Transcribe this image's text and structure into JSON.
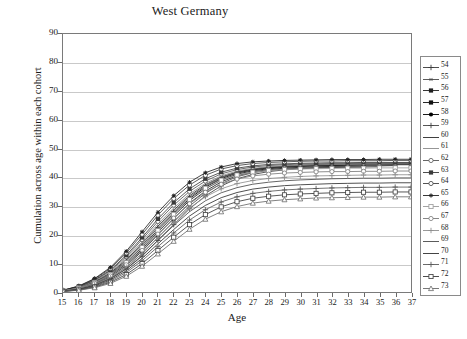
{
  "chart_data": {
    "type": "line",
    "title": "West Germany",
    "xlabel": "Age",
    "ylabel": "Cumulation across age within each cohort",
    "xlim": [
      15,
      37
    ],
    "ylim": [
      0,
      90
    ],
    "ytick_step": 10,
    "grid": true,
    "legend_position": "right-outside",
    "x": [
      15,
      16,
      17,
      18,
      19,
      20,
      21,
      22,
      23,
      24,
      25,
      26,
      27,
      28,
      29,
      30,
      31,
      32,
      33,
      34,
      35,
      36,
      37
    ],
    "yticks": [
      "0",
      "10",
      "20",
      "30",
      "40",
      "50",
      "60",
      "70",
      "80",
      "90"
    ],
    "xticks": [
      "15",
      "16",
      "17",
      "18",
      "19",
      "20",
      "21",
      "22",
      "23",
      "24",
      "25",
      "26",
      "27",
      "28",
      "29",
      "30",
      "31",
      "32",
      "33",
      "34",
      "35",
      "36",
      "37"
    ],
    "series": [
      {
        "name": "54",
        "marker": "plus",
        "color": "#3a3a3a",
        "values": [
          0.3,
          1.0,
          2.4,
          4.6,
          8.0,
          12.5,
          18.0,
          23.5,
          29.0,
          33.5,
          37.0,
          39.5,
          41.0,
          42.0,
          42.6,
          43.0,
          43.2,
          43.4,
          43.5,
          43.6,
          null,
          null,
          null
        ]
      },
      {
        "name": "55",
        "marker": "asterisk",
        "color": "#4a4a4a",
        "values": [
          0.3,
          1.1,
          2.6,
          5.0,
          8.6,
          13.4,
          19.0,
          24.6,
          30.0,
          34.4,
          37.8,
          40.2,
          41.6,
          42.4,
          42.9,
          43.2,
          43.4,
          43.5,
          43.6,
          43.6,
          43.7,
          null,
          null
        ]
      },
      {
        "name": "56",
        "marker": "square-filled",
        "color": "#1f1f1f",
        "values": [
          0.4,
          1.2,
          2.8,
          5.4,
          9.2,
          14.2,
          20.0,
          25.6,
          31.0,
          35.2,
          38.4,
          40.6,
          41.9,
          42.7,
          43.2,
          43.5,
          43.7,
          43.8,
          43.9,
          44.0,
          44.0,
          44.1,
          null
        ]
      },
      {
        "name": "57",
        "marker": "square-filled",
        "color": "#111111",
        "values": [
          0.4,
          1.3,
          3.0,
          5.8,
          9.8,
          15.0,
          20.9,
          26.6,
          31.9,
          36.0,
          39.0,
          41.1,
          42.3,
          43.0,
          43.5,
          43.8,
          44.0,
          44.1,
          44.2,
          44.3,
          44.3,
          44.4,
          44.4
        ]
      },
      {
        "name": "58",
        "marker": "circle-filled",
        "color": "#000000",
        "values": [
          0.4,
          1.4,
          3.2,
          6.1,
          10.3,
          15.7,
          21.7,
          27.4,
          32.6,
          36.6,
          39.5,
          41.5,
          42.6,
          43.3,
          43.7,
          44.0,
          44.2,
          44.3,
          44.4,
          44.5,
          44.5,
          44.6,
          44.6
        ]
      },
      {
        "name": "59",
        "marker": "plus",
        "color": "#444444",
        "values": [
          0.5,
          1.5,
          3.4,
          6.4,
          10.8,
          16.3,
          22.4,
          28.0,
          33.1,
          37.0,
          39.8,
          41.7,
          42.8,
          43.4,
          43.8,
          44.1,
          44.3,
          44.4,
          44.5,
          44.6,
          44.6,
          44.7,
          44.7
        ]
      },
      {
        "name": "60",
        "marker": "line",
        "color": "#2a2a2a",
        "values": [
          0.5,
          1.6,
          3.6,
          6.7,
          11.2,
          16.9,
          23.0,
          28.6,
          33.6,
          37.4,
          40.1,
          41.9,
          42.9,
          43.5,
          43.9,
          44.2,
          44.3,
          44.4,
          44.5,
          44.6,
          44.6,
          44.7,
          44.7
        ]
      },
      {
        "name": "61",
        "marker": "line",
        "color": "#8a8a8a",
        "values": [
          0.5,
          1.7,
          3.8,
          7.0,
          11.7,
          17.5,
          23.7,
          29.3,
          34.2,
          37.9,
          40.5,
          42.2,
          43.1,
          43.7,
          44.0,
          44.2,
          44.4,
          44.5,
          44.5,
          44.6,
          44.6,
          44.7,
          44.7
        ]
      },
      {
        "name": "62",
        "marker": "circle-open",
        "color": "#555555",
        "values": [
          0.5,
          1.8,
          4.0,
          7.4,
          12.3,
          18.3,
          24.6,
          30.3,
          35.1,
          38.7,
          41.2,
          42.7,
          43.6,
          44.1,
          44.4,
          44.6,
          44.7,
          44.8,
          44.8,
          44.9,
          44.9,
          45.0,
          45.0
        ]
      },
      {
        "name": "63",
        "marker": "square-filled",
        "color": "#3a3a3a",
        "values": [
          0.6,
          1.9,
          4.2,
          7.7,
          12.8,
          19.0,
          25.5,
          31.2,
          36.0,
          39.5,
          41.8,
          43.2,
          44.0,
          44.5,
          44.7,
          44.9,
          45.0,
          45.1,
          45.1,
          45.2,
          45.2,
          45.2,
          45.2
        ]
      },
      {
        "name": "64",
        "marker": "circle-open",
        "color": "#3f3f3f",
        "values": [
          0.6,
          2.0,
          4.5,
          8.2,
          13.6,
          20.1,
          26.8,
          32.6,
          37.3,
          40.7,
          42.9,
          44.1,
          44.8,
          45.2,
          45.4,
          45.6,
          45.7,
          45.7,
          45.8,
          45.8,
          45.8,
          45.9,
          45.9
        ]
      },
      {
        "name": "65",
        "marker": "star",
        "color": "#222222",
        "values": [
          0.6,
          2.1,
          4.7,
          8.6,
          14.2,
          21.0,
          27.8,
          33.6,
          38.3,
          41.6,
          43.6,
          44.8,
          45.4,
          45.7,
          45.9,
          46.0,
          46.1,
          46.2,
          46.2,
          46.2,
          46.3,
          46.3,
          46.3
        ]
      },
      {
        "name": "66",
        "marker": "square-open",
        "color": "#9a9a9a",
        "values": [
          0.4,
          1.4,
          3.2,
          6.0,
          10.2,
          15.5,
          21.4,
          27.1,
          32.2,
          36.2,
          39.0,
          40.8,
          41.8,
          42.4,
          42.7,
          42.9,
          43.0,
          43.1,
          43.2,
          43.2,
          43.3,
          43.3,
          43.3
        ]
      },
      {
        "name": "67",
        "marker": "circle-open",
        "color": "#7a7a7a",
        "values": [
          0.4,
          1.3,
          3.0,
          5.6,
          9.5,
          14.5,
          20.2,
          25.8,
          30.8,
          34.8,
          37.6,
          39.4,
          40.5,
          41.1,
          41.5,
          41.7,
          41.9,
          42.0,
          42.0,
          42.1,
          42.1,
          42.2,
          42.2
        ]
      },
      {
        "name": "68",
        "marker": "plus",
        "color": "#8f8f8f",
        "values": [
          0.3,
          1.1,
          2.6,
          5.0,
          8.7,
          13.5,
          19.0,
          24.4,
          29.3,
          33.2,
          36.0,
          37.8,
          38.9,
          39.6,
          40.0,
          40.3,
          40.5,
          40.6,
          40.7,
          40.8,
          40.8,
          40.9,
          40.9
        ]
      },
      {
        "name": "69",
        "marker": "line",
        "color": "#4a4a4a",
        "values": [
          0.3,
          1.0,
          2.4,
          4.7,
          8.1,
          12.7,
          18.0,
          23.2,
          28.0,
          31.8,
          34.6,
          36.4,
          37.6,
          38.3,
          38.8,
          39.1,
          39.3,
          39.5,
          39.6,
          39.7,
          39.7,
          39.8,
          39.8
        ]
      },
      {
        "name": "70",
        "marker": "line",
        "color": "#2f2f2f",
        "values": [
          0.3,
          0.9,
          2.1,
          4.2,
          7.4,
          11.7,
          16.8,
          21.8,
          26.5,
          30.2,
          32.9,
          34.7,
          35.9,
          36.6,
          37.1,
          37.4,
          37.6,
          37.8,
          37.9,
          38.0,
          38.0,
          38.1,
          38.1
        ]
      },
      {
        "name": "71",
        "marker": "plus",
        "color": "#5a5a5a",
        "values": [
          0.2,
          0.8,
          1.9,
          3.8,
          6.8,
          10.9,
          15.8,
          20.6,
          25.1,
          28.7,
          31.4,
          33.2,
          34.4,
          35.1,
          35.6,
          35.9,
          36.1,
          36.3,
          36.4,
          36.5,
          36.5,
          36.6,
          36.6
        ]
      },
      {
        "name": "72",
        "marker": "square-open",
        "color": "#3a3a3a",
        "values": [
          0.2,
          0.7,
          1.7,
          3.4,
          6.1,
          9.9,
          14.5,
          19.1,
          23.5,
          27.0,
          29.7,
          31.5,
          32.7,
          33.4,
          33.9,
          34.2,
          34.4,
          34.6,
          34.7,
          34.8,
          34.8,
          34.9,
          34.9
        ]
      },
      {
        "name": "73",
        "marker": "triangle-open",
        "color": "#6a6a6a",
        "values": [
          0.2,
          0.6,
          1.5,
          3.0,
          5.5,
          9.0,
          13.3,
          17.7,
          21.9,
          25.4,
          28.0,
          29.8,
          31.0,
          31.7,
          32.2,
          32.5,
          32.8,
          32.9,
          33.0,
          33.1,
          33.1,
          33.2,
          33.2
        ]
      }
    ]
  }
}
